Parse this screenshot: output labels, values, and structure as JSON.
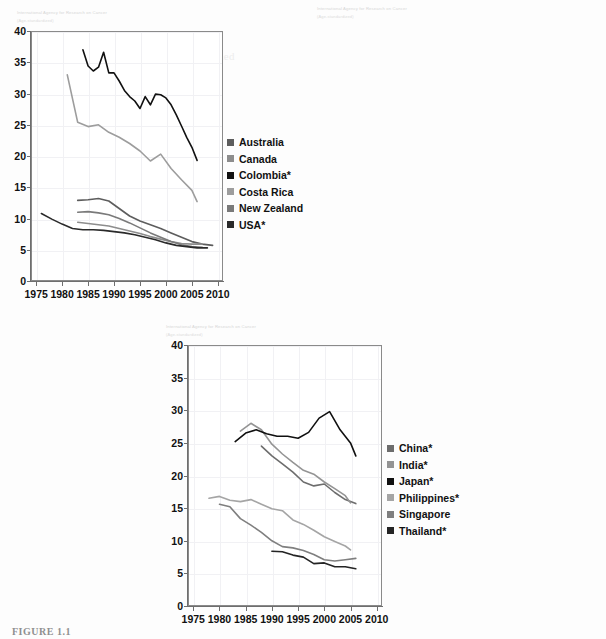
{
  "figure": {
    "caption": "FIGURE 1.1",
    "watermark_line1": "International Agency for Research on Cancer",
    "watermark_line2": "(Age-standardized)"
  },
  "axis": {
    "y_ticks": [
      "0",
      "5",
      "10",
      "15",
      "20",
      "25",
      "30",
      "35",
      "40"
    ],
    "x_ticks": [
      "1975",
      "1980",
      "1985",
      "1990",
      "1995",
      "2000",
      "2005",
      "2010"
    ],
    "ylim": [
      0,
      40
    ],
    "xlim": [
      1974,
      2011
    ]
  },
  "colors": {
    "dark": "#1f1f1f",
    "black": "#000000",
    "mid": "#6f6f6f",
    "light": "#a8a8a8",
    "lighter": "#9a9a9a",
    "frame": "#8a8a8a",
    "grid": "#f1f1f4"
  },
  "chart_data": [
    {
      "id": "panel-americas-oceania",
      "type": "line",
      "title": "",
      "xlabel": "",
      "ylabel": "",
      "xlim": [
        1974,
        2011
      ],
      "ylim": [
        0,
        40
      ],
      "grid": true,
      "legend_position": "right",
      "series": [
        {
          "name": "Australia",
          "color": "#5d5d5d",
          "x": [
            1983,
            1985,
            1987,
            1989,
            1991,
            1993,
            1995,
            1997,
            1999,
            2001,
            2003,
            2005,
            2007,
            2009
          ],
          "y": [
            12.9,
            13.0,
            13.2,
            12.8,
            11.6,
            10.4,
            9.6,
            9.0,
            8.4,
            7.7,
            7.0,
            6.3,
            5.9,
            5.7
          ]
        },
        {
          "name": "Canada",
          "color": "#8d8d8d",
          "x": [
            1983,
            1985,
            1987,
            1989,
            1991,
            1993,
            1995,
            1997,
            1999,
            2001,
            2003,
            2005,
            2007
          ],
          "y": [
            9.4,
            9.2,
            9.0,
            8.8,
            8.4,
            8.0,
            7.6,
            7.1,
            6.7,
            6.3,
            6.0,
            5.9,
            5.9
          ]
        },
        {
          "name": "Colombia*",
          "color": "#111111",
          "x": [
            1984,
            1985,
            1986,
            1987,
            1988,
            1989,
            1990,
            1991,
            1992,
            1993,
            1994,
            1995,
            1996,
            1997,
            1998,
            1999,
            2000,
            2001,
            2002,
            2003,
            2004,
            2005,
            2006
          ],
          "y": [
            37.0,
            34.4,
            33.6,
            34.2,
            36.6,
            33.3,
            33.3,
            32.0,
            30.5,
            29.5,
            28.8,
            27.6,
            29.5,
            28.2,
            29.9,
            29.8,
            29.3,
            28.2,
            26.6,
            24.8,
            23.0,
            21.4,
            19.3
          ]
        },
        {
          "name": "Costa Rica",
          "color": "#9d9d9d",
          "x": [
            1981,
            1983,
            1985,
            1987,
            1989,
            1991,
            1993,
            1995,
            1997,
            1999,
            2001,
            2003,
            2005,
            2006
          ],
          "y": [
            33.0,
            25.4,
            24.7,
            25.0,
            23.8,
            23.0,
            22.0,
            20.8,
            19.2,
            20.3,
            18.0,
            16.2,
            14.5,
            12.7
          ]
        },
        {
          "name": "New Zealand",
          "color": "#7a7a7a",
          "x": [
            1983,
            1985,
            1987,
            1989,
            1991,
            1993,
            1995,
            1997,
            1999,
            2001,
            2003,
            2005,
            2007
          ],
          "y": [
            11.0,
            11.1,
            10.9,
            10.6,
            10.0,
            9.3,
            8.5,
            7.7,
            7.0,
            6.3,
            5.8,
            5.5,
            5.4
          ]
        },
        {
          "name": "USA*",
          "color": "#2a2a2a",
          "x": [
            1976,
            1978,
            1980,
            1982,
            1984,
            1986,
            1988,
            1990,
            1992,
            1994,
            1996,
            1998,
            2000,
            2002,
            2004,
            2006,
            2008
          ],
          "y": [
            10.8,
            9.9,
            9.1,
            8.4,
            8.2,
            8.2,
            8.1,
            7.9,
            7.7,
            7.4,
            7.0,
            6.6,
            6.1,
            5.7,
            5.5,
            5.3,
            5.3
          ]
        }
      ]
    },
    {
      "id": "panel-europe",
      "type": "line",
      "title": "",
      "xlabel": "",
      "ylabel": "",
      "xlim": [
        1974,
        2011
      ],
      "ylim": [
        0,
        40
      ],
      "grid": true,
      "legend_position": "right",
      "series": [
        {
          "name": "Denmark",
          "color": "#4a4a4a",
          "x": [
            1975,
            1977,
            1979,
            1981,
            1983,
            1985,
            1987,
            1989,
            1991,
            1993,
            1995,
            1997,
            1999,
            2001,
            2003,
            2005,
            2007,
            2009,
            2010
          ],
          "y": [
            23.3,
            21.0,
            18.9,
            17.8,
            17.6,
            15.1,
            15.8,
            16.2,
            14.6,
            13.6,
            13.2,
            12.0,
            11.3,
            10.3,
            10.5,
            10.5,
            10.2,
            10.0,
            10.1
          ]
        },
        {
          "name": "Finland",
          "color": "#9b9b9b",
          "x": [
            1989,
            1991,
            1993,
            1995,
            1997,
            1999,
            2001,
            2003,
            2005,
            2007,
            2008
          ],
          "y": [
            6.9,
            6.6,
            6.9,
            6.7,
            6.5,
            6.7,
            6.6,
            6.8,
            6.9,
            6.4,
            5.9
          ]
        },
        {
          "name": "France*",
          "color": "#0a0a0a",
          "x": [
            1981,
            1983,
            1985,
            1986,
            1987,
            1989,
            1991,
            1993,
            1995,
            1997,
            1999,
            2001,
            2003,
            2005,
            2007,
            2008
          ],
          "y": [
            11.7,
            11.9,
            12.5,
            12.8,
            12.3,
            11.2,
            9.5,
            9.2,
            8.6,
            8.1,
            7.6,
            7.2,
            6.8,
            6.4,
            6.5,
            6.1
          ]
        },
        {
          "name": "Slovakia",
          "color": "#aeaeae",
          "x": [
            1979,
            1981,
            1983,
            1985,
            1987,
            1989,
            1991,
            1993,
            1995,
            1997,
            1999,
            2001,
            2003,
            2005,
            2006
          ],
          "y": [
            14.9,
            15.0,
            15.3,
            15.1,
            16.2,
            16.0,
            16.8,
            17.5,
            16.8,
            16.0,
            15.2,
            14.3,
            15.2,
            15.6,
            15.6
          ]
        },
        {
          "name": "Spain*",
          "color": "#8a8a8a",
          "x": [
            1975,
            1977,
            1979,
            1981,
            1983,
            1985,
            1987,
            1989,
            1991,
            1993,
            1995,
            1997,
            1999,
            2001,
            2003,
            2005,
            2007,
            2009,
            2010
          ],
          "y": [
            7.6,
            6.6,
            5.8,
            5.6,
            5.1,
            4.6,
            4.1,
            3.6,
            3.2,
            4.0,
            4.3,
            4.3,
            4.4,
            4.1,
            3.8,
            4.0,
            4.0,
            4.1,
            4.1
          ]
        },
        {
          "name": "England",
          "color": "#2b2b2b",
          "x": [
            1981,
            1983,
            1985,
            1987,
            1989,
            1991,
            1993,
            1995,
            1997,
            1999,
            2001,
            2003,
            2005,
            2007,
            2009,
            2010
          ],
          "y": [
            11.7,
            11.9,
            12.5,
            12.7,
            11.6,
            9.6,
            9.5,
            8.8,
            8.3,
            7.7,
            7.2,
            6.6,
            7.4,
            7.0,
            7.3,
            7.5
          ]
        }
      ]
    },
    {
      "id": "panel-asia",
      "type": "line",
      "title": "",
      "xlabel": "",
      "ylabel": "",
      "xlim": [
        1974,
        2011
      ],
      "ylim": [
        0,
        40
      ],
      "grid": true,
      "legend_position": "right",
      "series": [
        {
          "name": "China*",
          "color": "#6d6d6d",
          "x": [
            1988,
            1990,
            1992,
            1994,
            1996,
            1998,
            2000,
            2002,
            2004,
            2006
          ],
          "y": [
            24.5,
            23.0,
            21.8,
            20.5,
            19.0,
            18.4,
            18.7,
            17.4,
            16.3,
            15.7
          ]
        },
        {
          "name": "India*",
          "color": "#949494",
          "x": [
            1984,
            1986,
            1988,
            1990,
            1992,
            1994,
            1996,
            1998,
            2000,
            2002,
            2004,
            2005
          ],
          "y": [
            26.8,
            28.0,
            27.0,
            24.8,
            23.3,
            22.0,
            20.8,
            20.2,
            19.0,
            18.0,
            16.9,
            15.8
          ]
        },
        {
          "name": "Japan*",
          "color": "#101010",
          "x": [
            1983,
            1985,
            1987,
            1989,
            1991,
            1993,
            1995,
            1997,
            1999,
            2001,
            2003,
            2005,
            2006
          ],
          "y": [
            25.2,
            26.5,
            27.0,
            26.4,
            26.0,
            26.0,
            25.7,
            26.6,
            28.8,
            29.8,
            27.0,
            25.0,
            23.0
          ]
        },
        {
          "name": "Philippines*",
          "color": "#a5a5a5",
          "x": [
            1978,
            1980,
            1982,
            1984,
            1986,
            1988,
            1990,
            1992,
            1994,
            1996,
            1998,
            2000,
            2002,
            2004,
            2005
          ],
          "y": [
            16.5,
            16.8,
            16.2,
            16.0,
            16.3,
            15.6,
            14.9,
            14.6,
            13.2,
            12.5,
            11.6,
            10.6,
            9.9,
            9.2,
            8.6
          ]
        },
        {
          "name": "Singapore",
          "color": "#7f7f7f",
          "x": [
            1980,
            1982,
            1984,
            1986,
            1988,
            1990,
            1992,
            1994,
            1996,
            1998,
            2000,
            2002,
            2004,
            2006
          ],
          "y": [
            15.6,
            15.2,
            13.4,
            12.4,
            11.3,
            10.0,
            9.1,
            8.9,
            8.5,
            7.9,
            7.1,
            6.9,
            7.1,
            7.3
          ]
        },
        {
          "name": "Thailand*",
          "color": "#242424",
          "x": [
            1990,
            1992,
            1994,
            1996,
            1998,
            2000,
            2002,
            2004,
            2006
          ],
          "y": [
            8.4,
            8.3,
            7.8,
            7.5,
            6.5,
            6.6,
            6.0,
            6.0,
            5.7
          ]
        }
      ]
    }
  ],
  "panels": [
    {
      "legend_title": "",
      "legend": [
        "Australia",
        "Canada",
        "Colombia*",
        "Costa Rica",
        "New Zealand",
        "USA*"
      ]
    },
    {
      "legend_title": "",
      "legend": [
        "Denmark",
        "Finland",
        "France*",
        "Slovakia",
        "Spain*",
        "England"
      ]
    },
    {
      "legend_title": "",
      "legend": [
        "China*",
        "India*",
        "Japan*",
        "Philippines*",
        "Singapore",
        "Thailand*"
      ]
    }
  ],
  "bleed_text": {
    "lines": [
      "cancer incidence rates have declined",
      "considerable variation remains",
      "screening programmes in developing",
      "the burden of cervical cancer",
      "rates of invasive disease"
    ]
  }
}
